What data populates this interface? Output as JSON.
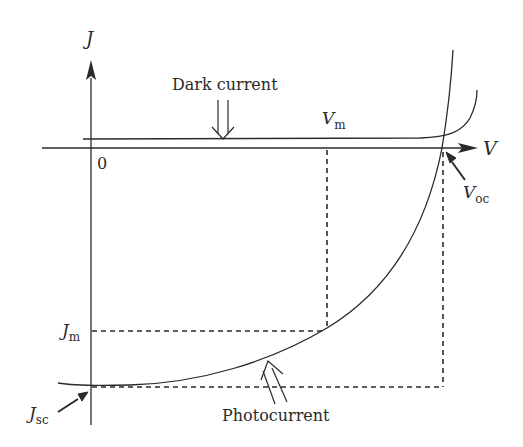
{
  "diagram": {
    "axes": {
      "x_label": "V",
      "y_label": "J",
      "origin_label": "0"
    },
    "labels": {
      "dark_current": "Dark current",
      "photocurrent": "Photocurrent",
      "v_m": {
        "main": "V",
        "sub": "m"
      },
      "v_oc": {
        "main": "V",
        "sub": "oc"
      },
      "j_m": {
        "main": "J",
        "sub": "m"
      },
      "j_sc": {
        "main": "J",
        "sub": "sc"
      }
    },
    "colors": {
      "stroke": "#2a2a2a",
      "background": "#ffffff"
    }
  }
}
